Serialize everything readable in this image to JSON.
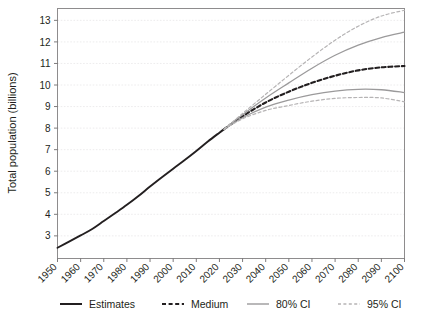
{
  "chart_data": {
    "type": "line",
    "title": "",
    "subtitle": "",
    "xlabel": "",
    "ylabel": "Total population (billions)",
    "xlim": [
      1950,
      2100
    ],
    "ylim": [
      1.95,
      13.55
    ],
    "xticks": [
      1950,
      1960,
      1970,
      1980,
      1990,
      2000,
      2010,
      2020,
      2030,
      2040,
      2050,
      2060,
      2070,
      2080,
      2090,
      2100
    ],
    "yticks": [
      3,
      4,
      5,
      6,
      7,
      8,
      9,
      10,
      11,
      12,
      13
    ],
    "grid": true,
    "legend_position": "bottom",
    "colors": {
      "estimates": "#231f20",
      "medium": "#231f20",
      "ci80": "#9b9a9b",
      "ci95": "#b6b4b5",
      "gridline": "#e9e7e8",
      "frame": "#8e8c8d",
      "text": "#231f20"
    },
    "series": [
      {
        "name": "Estimates",
        "style": "solid",
        "color": "#231f20",
        "width": 1.9,
        "x": [
          1950,
          1955,
          1960,
          1965,
          1970,
          1975,
          1980,
          1985,
          1990,
          1995,
          2000,
          2005,
          2010,
          2015,
          2020,
          2022
        ],
        "values": [
          2.45,
          2.73,
          3.02,
          3.32,
          3.69,
          4.06,
          4.44,
          4.85,
          5.29,
          5.71,
          6.12,
          6.52,
          6.94,
          7.38,
          7.79,
          7.95
        ]
      },
      {
        "name": "Medium",
        "style": "dashed",
        "color": "#231f20",
        "width": 2.1,
        "x": [
          2022,
          2030,
          2040,
          2050,
          2060,
          2070,
          2080,
          2090,
          2100
        ],
        "values": [
          7.95,
          8.55,
          9.19,
          9.69,
          10.1,
          10.43,
          10.68,
          10.82,
          10.88
        ]
      },
      {
        "name": "80% CI upper",
        "style": "solid",
        "color": "#9b9a9b",
        "width": 1.3,
        "x": [
          2022,
          2030,
          2040,
          2050,
          2060,
          2070,
          2080,
          2090,
          2100
        ],
        "values": [
          7.95,
          8.62,
          9.4,
          10.1,
          10.78,
          11.38,
          11.85,
          12.2,
          12.45
        ]
      },
      {
        "name": "80% CI lower",
        "style": "solid",
        "color": "#9b9a9b",
        "width": 1.3,
        "x": [
          2022,
          2030,
          2040,
          2050,
          2060,
          2070,
          2080,
          2090,
          2100
        ],
        "values": [
          7.95,
          8.48,
          8.97,
          9.3,
          9.55,
          9.72,
          9.8,
          9.78,
          9.65
        ]
      },
      {
        "name": "95% CI upper",
        "style": "dashed",
        "color": "#b6b4b5",
        "width": 1.2,
        "x": [
          2022,
          2030,
          2040,
          2050,
          2060,
          2070,
          2080,
          2090,
          2100
        ],
        "values": [
          7.95,
          8.68,
          9.57,
          10.45,
          11.3,
          12.08,
          12.73,
          13.2,
          13.47
        ]
      },
      {
        "name": "95% CI lower",
        "style": "dashed",
        "color": "#b6b4b5",
        "width": 1.2,
        "x": [
          2022,
          2030,
          2040,
          2050,
          2060,
          2070,
          2080,
          2090,
          2100
        ],
        "values": [
          7.95,
          8.43,
          8.82,
          9.05,
          9.25,
          9.38,
          9.42,
          9.4,
          9.22
        ]
      }
    ],
    "annotations": []
  },
  "axis": {
    "y_title": "Total population (billions)",
    "y_tick_labels": [
      "13",
      "12",
      "11",
      "10",
      "9",
      "8",
      "7",
      "6",
      "5",
      "4",
      "3"
    ],
    "x_tick_labels": [
      "1950",
      "1960",
      "1970",
      "1980",
      "1990",
      "2000",
      "2010",
      "2020",
      "2030",
      "2040",
      "2050",
      "2060",
      "2070",
      "2080",
      "2090",
      "2100"
    ]
  },
  "legend": {
    "items": [
      {
        "label": "Estimates",
        "style": "solid",
        "color": "#231f20",
        "width": 2.0
      },
      {
        "label": "Medium",
        "style": "dashed",
        "color": "#231f20",
        "width": 2.0
      },
      {
        "label": "80% CI",
        "style": "solid",
        "color": "#9b9a9b",
        "width": 1.4
      },
      {
        "label": "95% CI",
        "style": "dashed",
        "color": "#b6b4b5",
        "width": 1.3
      }
    ]
  }
}
